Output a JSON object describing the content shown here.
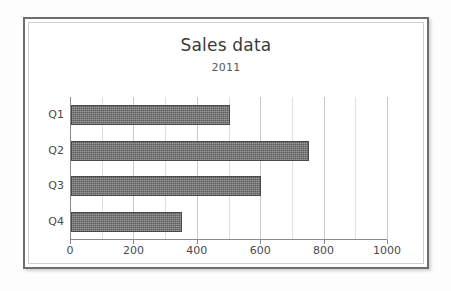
{
  "chart_data": {
    "type": "bar",
    "orientation": "horizontal",
    "title": "Sales data",
    "subtitle": "2011",
    "categories": [
      "Q1",
      "Q2",
      "Q3",
      "Q4"
    ],
    "values": [
      500,
      750,
      600,
      350
    ],
    "xlabel": "",
    "ylabel": "",
    "xlim": [
      0,
      1000
    ],
    "xticks": [
      0,
      200,
      400,
      600,
      800,
      1000
    ],
    "xtick_labels": [
      "0",
      "200",
      "400",
      "600",
      "800",
      "1000"
    ],
    "grid": true,
    "grid_axis": "x",
    "grid_minor_step": 100,
    "legend": false,
    "bar_color": "#5c5c5c",
    "frame_color": "#6e6e6e",
    "grid_color": "#dedede",
    "text_color": "#4a4a4a"
  }
}
